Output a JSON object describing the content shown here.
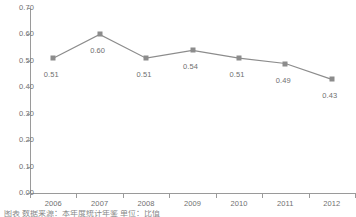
{
  "chart_data": {
    "type": "line",
    "title": "",
    "xlabel": "",
    "ylabel": "",
    "categories": [
      "2006",
      "2007",
      "2008",
      "2009",
      "2010",
      "2011",
      "2012"
    ],
    "values": [
      0.51,
      0.6,
      0.51,
      0.54,
      0.51,
      0.49,
      0.43
    ],
    "point_labels": [
      "0.51",
      "0.60",
      "0.51",
      "0.54",
      "0.51",
      "0.49",
      "0.43"
    ],
    "ylim": [
      0.0,
      0.7
    ],
    "ytick_step": 0.1,
    "ytick_labels": [
      "0.70",
      "0.60",
      "0.50",
      "0.40",
      "0.30",
      "0.20",
      "0.10",
      "0.00"
    ],
    "ytick_values": [
      0.7,
      0.6,
      0.5,
      0.4,
      0.3,
      0.2,
      0.1,
      0.0
    ],
    "grid": false,
    "legend": null,
    "series_color": "#8c8c8c",
    "marker": "square",
    "axis_color": "#9a9a9a",
    "text_color": "#6f6f6f",
    "background": "#ffffff"
  },
  "caption": {
    "text": "图表  数据来源：本年度统计年鉴  单位：比值"
  }
}
